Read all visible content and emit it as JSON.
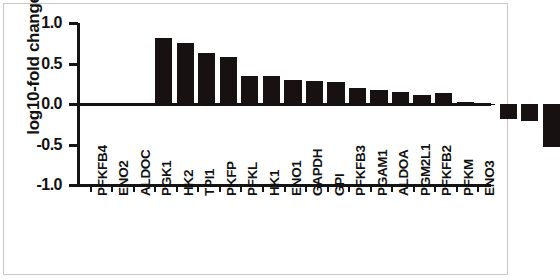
{
  "figure": {
    "y_axis_title": "log10-fold change",
    "y_ticks": [
      "1.0",
      "0.5",
      "0.0",
      "-0.5",
      "-1.0"
    ]
  },
  "chart_data": {
    "type": "bar",
    "title": "",
    "xlabel": "",
    "ylabel": "log10-fold change",
    "ylim": [
      -1.0,
      1.0
    ],
    "yticks": [
      1.0,
      0.5,
      0.0,
      -0.5,
      -1.0
    ],
    "grid": false,
    "legend": null,
    "bar_color": "#171211",
    "orientation": "vertical",
    "categories": [
      "PFKFB4",
      "ENO2",
      "ALDOC",
      "PGK1",
      "HK2",
      "TPI1",
      "PKFP",
      "PFKL",
      "HK1",
      "ENO1",
      "GAPDH",
      "GPI",
      "PFKFB3",
      "PGAM1",
      "ALDOA",
      "PGM2L1",
      "PFKFB2",
      "PFKM",
      "ENO3"
    ],
    "values": [
      0.81,
      0.75,
      0.63,
      0.58,
      0.35,
      0.34,
      0.3,
      0.29,
      0.27,
      0.2,
      0.17,
      0.15,
      0.11,
      0.13,
      0.02,
      0.005,
      -0.18,
      -0.21,
      -0.53
    ]
  }
}
